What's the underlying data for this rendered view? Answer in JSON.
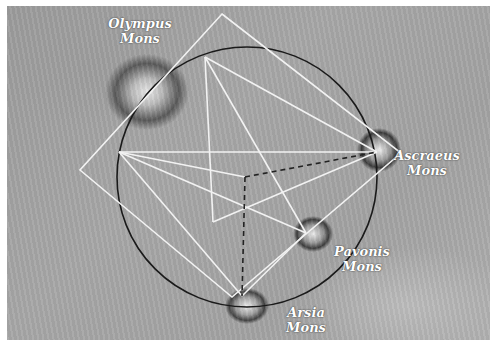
{
  "image": {
    "description": "Shaded-relief map of the Tharsis region of Mars with a geometric overlay (circle, square, star lines) connecting volcanoes",
    "width": 493,
    "height": 346
  },
  "labels": [
    {
      "id": "olympus",
      "line1": "Olympus",
      "line2": "Mons",
      "x": 140,
      "y": 16
    },
    {
      "id": "ascraeus",
      "line1": "Ascraeus",
      "line2": "Mons",
      "x": 427,
      "y": 148
    },
    {
      "id": "pavonis",
      "line1": "Pavonis",
      "line2": "Mons",
      "x": 362,
      "y": 244
    },
    {
      "id": "arsia",
      "line1": "Arsia",
      "line2": "Mons",
      "x": 306,
      "y": 305
    }
  ],
  "geometry": {
    "colors": {
      "circle": "#1a1a1a",
      "lines": "#f2f2f2",
      "dashed": "#222222"
    },
    "circle": {
      "cx": 247,
      "cy": 177,
      "r": 130
    },
    "square": [
      [
        222,
        14
      ],
      [
        401,
        153
      ],
      [
        232,
        297
      ],
      [
        80,
        170
      ]
    ],
    "vertices": {
      "top": [
        205,
        57
      ],
      "left": [
        119,
        152
      ],
      "ascraeus": [
        377,
        152
      ],
      "pavonis": [
        306,
        233
      ],
      "arsia": [
        242,
        296
      ],
      "center": [
        245,
        177
      ],
      "inner": [
        213,
        222
      ]
    },
    "star_lines": [
      [
        "top",
        "pavonis"
      ],
      [
        "top",
        "inner"
      ],
      [
        "top",
        "ascraeus"
      ],
      [
        "left",
        "ascraeus"
      ],
      [
        "left",
        "pavonis"
      ],
      [
        "left",
        "center"
      ],
      [
        "ascraeus",
        "inner"
      ],
      [
        "pavonis",
        "arsia"
      ],
      [
        "left",
        "arsia"
      ]
    ],
    "dashed_lines": [
      [
        "center",
        "ascraeus"
      ],
      [
        "center",
        "arsia"
      ]
    ]
  }
}
